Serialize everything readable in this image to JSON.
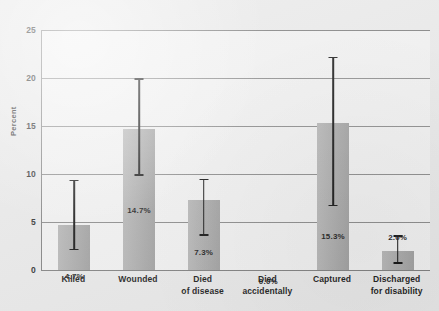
{
  "chart_data": {
    "type": "bar",
    "title": "",
    "subtitle": "",
    "xlabel": "",
    "ylabel": "Percent",
    "ylim": [
      0,
      25
    ],
    "yticks": [
      0,
      5,
      10,
      15,
      20,
      25
    ],
    "ytick_labels": [
      "0",
      "5",
      "10",
      "15",
      "20",
      "25"
    ],
    "grid": true,
    "legend": "none",
    "categories": [
      "Killed",
      "Wounded",
      "Died\nof disease",
      "Died\naccidentally",
      "Captured",
      "Discharged\nfor disability"
    ],
    "values": [
      4.7,
      14.7,
      7.3,
      0.0,
      15.3,
      2.0
    ],
    "value_labels": [
      "4.7%",
      "14.7%",
      "7.3%",
      "0.0%",
      "15.3%",
      "2.0%"
    ],
    "error_bars": [
      {
        "category": "Killed",
        "low": 2.2,
        "high": 9.4
      },
      {
        "category": "Wounded",
        "low": 10.0,
        "high": 20.0
      },
      {
        "category": "Died of disease",
        "low": 3.7,
        "high": 9.5
      },
      {
        "category": "Died accidentally",
        "low": null,
        "high": null
      },
      {
        "category": "Captured",
        "low": 6.8,
        "high": 22.2
      },
      {
        "category": "Discharged for disability",
        "low": 0.8,
        "high": 3.6
      }
    ],
    "series": [
      {
        "name": "Percent",
        "values": [
          4.7,
          14.7,
          7.3,
          0.0,
          15.3,
          2.0
        ]
      }
    ],
    "colors": {
      "bar": "#a9a9a9",
      "error_bar": "#111111",
      "gridline": "#8a8a8a",
      "axis": "#808080",
      "plot_background": "#f1f1f1",
      "figure_background": "#e9e9e9",
      "text": "#1d1d1d"
    }
  }
}
